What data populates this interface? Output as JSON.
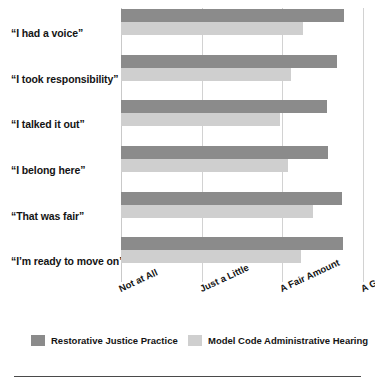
{
  "chart_data": {
    "type": "bar",
    "orientation": "horizontal",
    "title": "",
    "subtitle": "",
    "xlabel": "",
    "ylabel": "",
    "xlim": [
      0,
      3
    ],
    "grid": true,
    "legend_position": "bottom",
    "categories": [
      "“I had a voice”",
      "“I took responsibility”",
      "“I talked it out”",
      "“I belong here”",
      "“That was fair”",
      "“I’m ready to move on”"
    ],
    "xtick_labels": [
      "Not at All",
      "Just a Little",
      "A Fair Amount",
      "A Great Amount"
    ],
    "xtick_values": [
      0,
      1,
      2,
      3
    ],
    "series": [
      {
        "name": "Restorative Justice Practice",
        "color": "#8b8b8b",
        "values": [
          2.76,
          2.68,
          2.55,
          2.57,
          2.74,
          2.75
        ]
      },
      {
        "name": "Model Code Administrative Hearing",
        "color": "#cfcfcf",
        "values": [
          2.26,
          2.11,
          1.97,
          2.07,
          2.38,
          2.23
        ]
      }
    ]
  },
  "legend": {
    "items": [
      {
        "label": "Restorative Justice Practice",
        "color": "#8b8b8b"
      },
      {
        "label": "Model Code Administrative Hearing",
        "color": "#cfcfcf"
      }
    ]
  }
}
